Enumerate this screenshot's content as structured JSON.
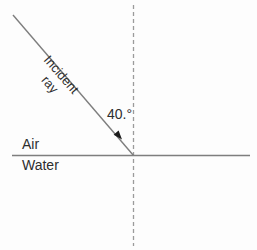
{
  "diagram": {
    "type": "ray-diagram",
    "labels": {
      "incident_line1": "Incident",
      "incident_line2": "ray",
      "angle": "40.°",
      "upper_medium": "Air",
      "lower_medium": "Water"
    },
    "colors": {
      "background": "#fdfdfd",
      "line": "#7e7e7e",
      "dashed": "#9b9b9b",
      "text": "#2e2e2e",
      "arrow": "#1b1b1b"
    }
  }
}
